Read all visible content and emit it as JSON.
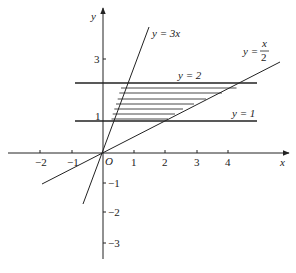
{
  "diagram": {
    "title": "",
    "axes": {
      "x_label": "x",
      "y_label": "y",
      "origin_label": "O",
      "x_ticks": [
        {
          "value": -2,
          "label": "−2"
        },
        {
          "value": -1,
          "label": "−1"
        },
        {
          "value": 1,
          "label": "1"
        },
        {
          "value": 2,
          "label": "2"
        },
        {
          "value": 3,
          "label": "3"
        },
        {
          "value": 4,
          "label": "4"
        }
      ],
      "y_ticks": [
        {
          "value": 3,
          "label": "3"
        },
        {
          "value": 1,
          "label": "1"
        },
        {
          "value": -1,
          "label": "−1"
        },
        {
          "value": -2,
          "label": "−2"
        },
        {
          "value": -3,
          "label": "−3"
        }
      ]
    },
    "lines": [
      {
        "id": "y3x",
        "equation": "y = 3x",
        "label_main": "y = 3x"
      },
      {
        "id": "yx2",
        "equation": "y = x/2",
        "label_lhs": "y =",
        "label_num": "x",
        "label_den": "2"
      },
      {
        "id": "y2",
        "equation": "y = 2",
        "label_main": "y = 2"
      },
      {
        "id": "y1",
        "equation": "y = 1",
        "label_main": "y = 1"
      }
    ],
    "shaded_region": {
      "description": "Region bounded by y = 1, y = 2, y = 3x and y = x/2",
      "vertices": [
        [
          0.333,
          1
        ],
        [
          2,
          1
        ],
        [
          4,
          2
        ],
        [
          0.667,
          2
        ]
      ],
      "hatch_count": 7
    },
    "colors": {
      "ink": "#222222",
      "background": "#ffffff"
    }
  }
}
